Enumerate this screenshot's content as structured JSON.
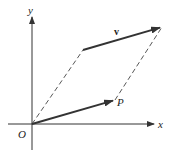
{
  "diagram": {
    "type": "vector-parallelogram",
    "colors": {
      "axis": "#333333",
      "vector": "#333333",
      "dashed": "#444444",
      "background": "#ffffff"
    },
    "labels": {
      "origin": "O",
      "x_axis": "x",
      "y_axis": "y",
      "point": "P",
      "vector": "v"
    },
    "elements": [
      {
        "kind": "axis",
        "name": "x-axis",
        "from": [
          8,
          124
        ],
        "to": [
          154,
          124
        ]
      },
      {
        "kind": "axis",
        "name": "y-axis",
        "from": [
          32,
          150
        ],
        "to": [
          32,
          17
        ]
      },
      {
        "kind": "vector",
        "name": "position-vector-OP",
        "from": [
          32,
          124
        ],
        "to": [
          115,
          100
        ]
      },
      {
        "kind": "vector",
        "name": "vector-v",
        "from": [
          83,
          50
        ],
        "to": [
          162,
          27
        ]
      },
      {
        "kind": "dashed",
        "name": "dashed-O-to-v-tail",
        "from": [
          32,
          124
        ],
        "to": [
          83,
          50
        ]
      },
      {
        "kind": "dashed",
        "name": "dashed-P-to-v-head",
        "from": [
          115,
          100
        ],
        "to": [
          162,
          27
        ]
      }
    ]
  }
}
